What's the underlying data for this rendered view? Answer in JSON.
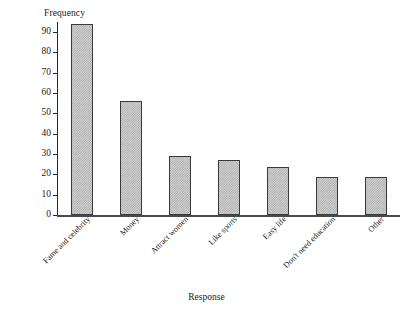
{
  "chart_data": {
    "type": "bar",
    "title": "",
    "xlabel": "Response",
    "ylabel": "Frequency",
    "categories": [
      "Fame and celebrity",
      "Money",
      "Attract women",
      "Like sports",
      "Easy life",
      "Don't need education",
      "Other"
    ],
    "values": [
      94,
      56,
      29,
      27,
      23.5,
      18.5,
      18.5
    ],
    "ylim": [
      0,
      95
    ],
    "yticks": [
      0,
      10,
      20,
      30,
      40,
      50,
      60,
      70,
      80,
      90
    ],
    "ytick_labels": [
      "0",
      "10",
      "20",
      "30",
      "40",
      "50",
      "60",
      "70",
      "80",
      "90"
    ],
    "grid": false,
    "legend": false,
    "bar_fill_color": "#d2d2d2",
    "bar_edge_color": "#3a3a3a",
    "axis_color": "#2b2b2b",
    "background_color": "#ffffff"
  }
}
